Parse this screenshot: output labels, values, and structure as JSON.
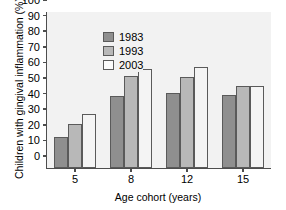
{
  "chart_data": {
    "type": "bar",
    "title": "",
    "xlabel": "Age cohort (years)",
    "ylabel": "Children with gingival inflammation (%)",
    "categories": [
      "5",
      "8",
      "12",
      "15"
    ],
    "series": [
      {
        "name": "1983",
        "color": "#8f8f8f",
        "values": [
          20,
          46,
          48,
          47
        ]
      },
      {
        "name": "1993",
        "color": "#b8b8b8",
        "values": [
          28,
          59,
          58.5,
          52.5
        ]
      },
      {
        "name": "2003",
        "color": "#f4f4f4",
        "values": [
          34.5,
          63.5,
          65,
          52.5
        ]
      }
    ],
    "ylim": [
      0,
      100
    ],
    "yticks": [
      0,
      10,
      20,
      30,
      40,
      50,
      60,
      70,
      80,
      90,
      100
    ],
    "ytick_labels": [
      "0",
      "10",
      "20",
      "30",
      "40",
      "50",
      "60",
      "70",
      "80",
      "90",
      "100"
    ],
    "grid": false,
    "legend_position": "upper-left",
    "legend_entries": [
      "1983",
      "1993",
      "2003"
    ],
    "plot_background": "#f2f2f2",
    "axis_color": "#4d4d4d"
  }
}
